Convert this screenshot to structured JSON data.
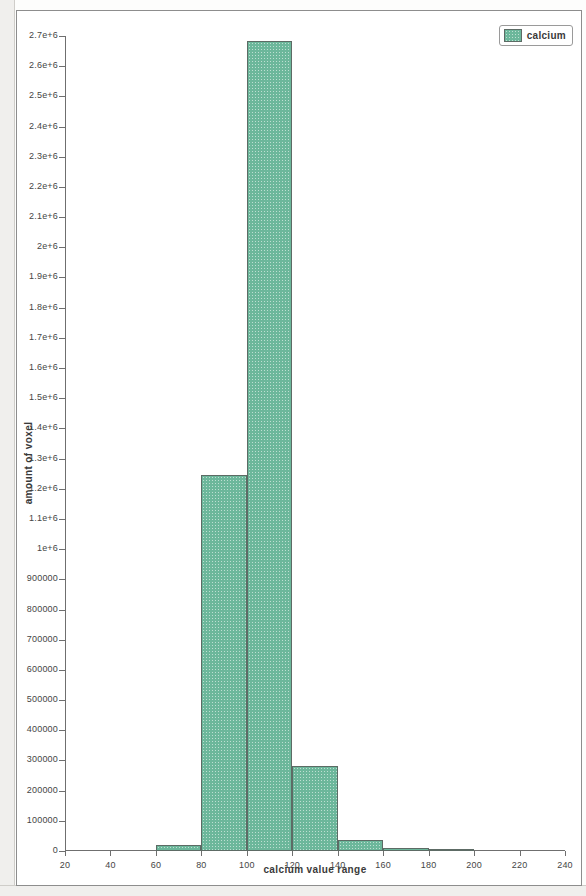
{
  "chart_data": {
    "type": "bar",
    "title": "",
    "xlabel": "calcium value range",
    "ylabel": "amount of voxel",
    "xlim": [
      20,
      240
    ],
    "ylim": [
      0,
      2700000
    ],
    "grid": false,
    "legend_position": "top-right",
    "bin_width": 20,
    "x_tick_labels": [
      "20",
      "40",
      "60",
      "80",
      "100",
      "120",
      "140",
      "160",
      "180",
      "200",
      "220",
      "240"
    ],
    "x_tick_values": [
      20,
      40,
      60,
      80,
      100,
      120,
      140,
      160,
      180,
      200,
      220,
      240
    ],
    "y_tick_labels": [
      "2.7e+6",
      "2.6e+6",
      "2.5e+6",
      "2.4e+6",
      "2.3e+6",
      "2.2e+6",
      "2.1e+6",
      "2e+6",
      "1.9e+6",
      "1.8e+6",
      "1.7e+6",
      "1.6e+6",
      "1.5e+6",
      "1.4e+6",
      "1.3e+6",
      "1.2e+6",
      "1.1e+6",
      "1e+6",
      "900000",
      "800000",
      "700000",
      "600000",
      "500000",
      "400000",
      "300000",
      "200000",
      "100000",
      "0"
    ],
    "y_tick_values": [
      2700000,
      2600000,
      2500000,
      2400000,
      2300000,
      2200000,
      2100000,
      2000000,
      1900000,
      1800000,
      1700000,
      1600000,
      1500000,
      1400000,
      1300000,
      1200000,
      1100000,
      1000000,
      900000,
      800000,
      700000,
      600000,
      500000,
      400000,
      300000,
      200000,
      100000,
      0
    ],
    "series": [
      {
        "name": "calcium",
        "color": "#6cb79b",
        "bins": [
          {
            "x0": 60,
            "x1": 80,
            "value": 20000
          },
          {
            "x0": 80,
            "x1": 100,
            "value": 1247000
          },
          {
            "x0": 100,
            "x1": 120,
            "value": 2685000
          },
          {
            "x0": 120,
            "x1": 140,
            "value": 283000
          },
          {
            "x0": 140,
            "x1": 160,
            "value": 35000
          },
          {
            "x0": 160,
            "x1": 180,
            "value": 9000
          },
          {
            "x0": 180,
            "x1": 200,
            "value": 2000
          }
        ]
      }
    ],
    "categories": [
      "60-80",
      "80-100",
      "100-120",
      "120-140",
      "140-160",
      "160-180",
      "180-200"
    ],
    "values": [
      20000,
      1247000,
      2685000,
      283000,
      35000,
      9000,
      2000
    ]
  },
  "legend": {
    "entries": [
      {
        "label": "calcium",
        "color": "#6cb79b"
      }
    ]
  },
  "axes": {
    "x_title": "calcium value range",
    "y_title": "amount of voxel"
  }
}
